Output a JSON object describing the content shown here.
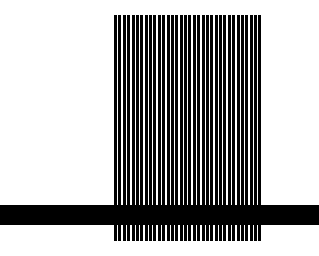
{
  "figure": {
    "background": "#ffffff",
    "stripes": {
      "count": 34,
      "color": "#000000",
      "x": 114,
      "y": 15,
      "width": 149,
      "height": 226
    },
    "horizontal_bar": {
      "color": "#000000",
      "x": 0,
      "y": 205,
      "width": 319,
      "height": 20
    }
  }
}
